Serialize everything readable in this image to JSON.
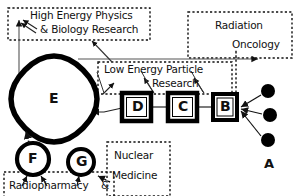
{
  "diagram": {
    "style": {
      "ink": "#111111",
      "background": "#ffffff",
      "dashed_box_stroke": "#111111",
      "node_fill": "#ffffff",
      "source_dot_fill": "#000000"
    },
    "dashed_boxes": [
      {
        "id": "high-energy",
        "name": "high-energy-physics-box",
        "lines": [
          "High Energy Physics",
          "& Biology Research"
        ],
        "x": 8,
        "y": 8,
        "w": 142,
        "h": 32
      },
      {
        "id": "radiation-oncology",
        "name": "radiation-oncology-box",
        "lines": [
          "Radiation",
          "Oncology"
        ],
        "x": 188,
        "y": 12,
        "w": 104,
        "h": 46
      },
      {
        "id": "low-energy",
        "name": "low-energy-particle-research-box",
        "lines": [
          "Low Energy Particle",
          "Research"
        ],
        "x": 98,
        "y": 62,
        "w": 134,
        "h": 32
      },
      {
        "id": "nuclear-medicine",
        "name": "nuclear-medicine-box",
        "lines": [
          "Nuclear",
          "Medicine"
        ],
        "x": 107,
        "y": 142,
        "w": 63,
        "h": 50
      },
      {
        "id": "radiopharmacy",
        "name": "radiopharmacy-box",
        "lines": [
          "Radiopharmacy    &"
        ],
        "x": 4,
        "y": 172,
        "w": 110,
        "h": 24
      }
    ],
    "nodes": [
      {
        "id": "E",
        "name": "node-e-squircle",
        "label": "E",
        "shape": "squircle",
        "cx": 54,
        "cy": 99,
        "r": 43
      },
      {
        "id": "D",
        "name": "node-d-box",
        "label": "D",
        "shape": "square",
        "x": 122,
        "y": 93,
        "w": 29,
        "h": 28
      },
      {
        "id": "C",
        "name": "node-c-box",
        "label": "C",
        "shape": "square",
        "x": 168,
        "y": 93,
        "w": 29,
        "h": 28
      },
      {
        "id": "B",
        "name": "node-b-box",
        "label": "B",
        "shape": "square",
        "x": 213,
        "y": 94,
        "w": 24,
        "h": 26
      },
      {
        "id": "F",
        "name": "node-f-circle",
        "label": "F",
        "shape": "circle",
        "cx": 33,
        "cy": 159,
        "r": 16
      },
      {
        "id": "G",
        "name": "node-g-circle",
        "label": "G",
        "shape": "circle",
        "cx": 81,
        "cy": 162,
        "r": 13
      }
    ],
    "source_group": {
      "id": "A",
      "name": "source-group-a",
      "label": "A",
      "label_x": 264,
      "label_y": 166,
      "dots": [
        {
          "cx": 268,
          "cy": 91,
          "r": 7
        },
        {
          "cx": 270,
          "cy": 115,
          "r": 7
        },
        {
          "cx": 268,
          "cy": 140,
          "r": 7
        }
      ]
    },
    "connections": [
      {
        "name": "a-dots-to-b",
        "from": "A",
        "to": "B",
        "style": "solid-arrow"
      },
      {
        "name": "b-to-c",
        "from": "B",
        "to": "C",
        "style": "solid-line"
      },
      {
        "name": "c-to-d",
        "from": "C",
        "to": "D",
        "style": "solid-line"
      },
      {
        "name": "d-to-e",
        "from": "D",
        "to": "E",
        "style": "solid-arrow"
      },
      {
        "name": "d-to-low-energy",
        "from": "D",
        "to": "low-energy",
        "style": "solid-arrow"
      },
      {
        "name": "c-to-low-energy",
        "from": "C",
        "to": "low-energy",
        "style": "solid-arrow"
      },
      {
        "name": "b-to-low-energy",
        "from": "B",
        "to": "low-energy",
        "style": "solid-arrow"
      },
      {
        "name": "e-to-low-energy",
        "from": "E",
        "to": "low-energy",
        "style": "solid-arrow"
      },
      {
        "name": "e-to-high-energy",
        "from": "E",
        "to": "high-energy",
        "style": "solid-arrow"
      },
      {
        "name": "e-to-high-energy-fan",
        "from": "E",
        "to": "high-energy",
        "style": "solid-arrow"
      },
      {
        "name": "e-to-radiation-oncology",
        "from": "E",
        "to": "radiation-oncology",
        "style": "solid-arrow"
      },
      {
        "name": "radiation-oncology-dotted-drop",
        "from": "radiation-oncology",
        "to": "B",
        "style": "dotted-line"
      },
      {
        "name": "f-to-e",
        "from": "F",
        "to": "E",
        "style": "dotted-arrow"
      },
      {
        "name": "radiopharmacy-to-f",
        "from": "radiopharmacy",
        "to": "F",
        "style": "solid-arrow"
      },
      {
        "name": "radiopharmacy-to-g",
        "from": "radiopharmacy",
        "to": "G",
        "style": "solid-arrow"
      },
      {
        "name": "g-to-nuclear-medicine",
        "from": "G",
        "to": "nuclear-medicine",
        "style": "dotted-arrow"
      }
    ]
  }
}
